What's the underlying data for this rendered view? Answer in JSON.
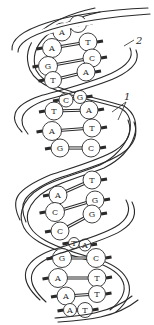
{
  "figure": {
    "labels": {
      "hydrogen_bonds": "1",
      "backbone": "2"
    },
    "base_pairs": [
      {
        "left": "A",
        "right": "T"
      },
      {
        "left": "A",
        "right": "T"
      },
      {
        "left": "G",
        "right": "C"
      },
      {
        "left": "T",
        "right": "A"
      },
      {
        "left": "C",
        "right": "G"
      },
      {
        "left": "T",
        "right": "A"
      },
      {
        "left": "A",
        "right": "T"
      },
      {
        "left": "G",
        "right": "C"
      },
      {
        "left": "A",
        "right": "T"
      },
      {
        "left": "C",
        "right": "G"
      },
      {
        "left": "C",
        "right": "G"
      },
      {
        "left": "T",
        "right": "A"
      },
      {
        "left": "G",
        "right": "C"
      },
      {
        "left": "A",
        "right": "T"
      },
      {
        "left": "A",
        "right": "T"
      },
      {
        "left": "A",
        "right": "T"
      }
    ],
    "colors": {
      "ink": "#2a2a2a",
      "paper": "#ffffff"
    }
  }
}
